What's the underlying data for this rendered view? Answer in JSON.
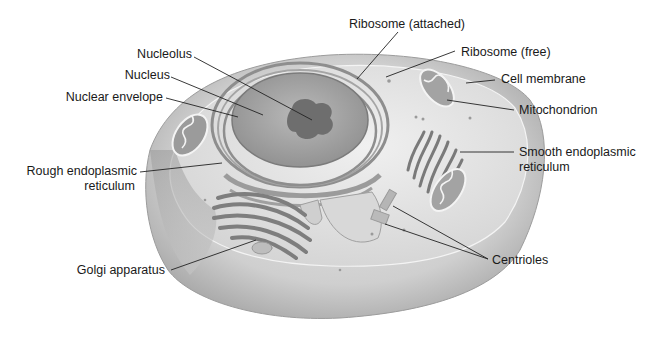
{
  "figure": {
    "colors": {
      "background": "#ffffff",
      "cell_outer": "#cfcfcf",
      "cytoplasm": "#e3e3e3",
      "nucleus": "#a9a9a9",
      "nucleolus": "#6f6f6f",
      "organelle": "#8d8d8d",
      "label_text": "#1a1a1a",
      "leader_line": "#222222"
    }
  },
  "labels": {
    "nucleolus": "Nucleolus",
    "nucleus": "Nucleus",
    "nuclear_envelope": "Nuclear envelope",
    "rough_er_line1": "Rough endoplasmic",
    "rough_er_line2": "reticulum",
    "golgi": "Golgi apparatus",
    "ribosome_attached": "Ribosome (attached)",
    "ribosome_free": "Ribosome (free)",
    "cell_membrane": "Cell membrane",
    "mitochondrion": "Mitochondrion",
    "smooth_er_line1": "Smooth endoplasmic",
    "smooth_er_line2": "reticulum",
    "centrioles": "Centrioles"
  }
}
